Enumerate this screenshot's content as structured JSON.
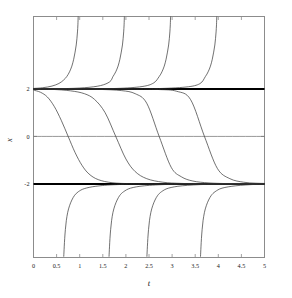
{
  "chart_data": {
    "type": "line",
    "title": "",
    "subtitle": "",
    "xlabel": "t",
    "ylabel": "x",
    "xlim": [
      0,
      5
    ],
    "ylim": [
      -5.1,
      5.05
    ],
    "grid": false,
    "legend": null,
    "legend_position": "none",
    "xticks": [
      0,
      0.5,
      1,
      1.5,
      2,
      2.5,
      3,
      3.5,
      4,
      4.5,
      5
    ],
    "xticklabels": [
      "0",
      "0.5",
      "1",
      "1.5",
      "2",
      "2.5",
      "3",
      "3.5",
      "4",
      "4.5",
      "5"
    ],
    "yticks": [
      2,
      0,
      -2
    ],
    "yticklabels": [
      "2",
      "0",
      "-2"
    ],
    "ticks_on_all_sides": true,
    "annotations": [
      "Equilibrium solution x = 2 drawn as a heavy horizontal line",
      "Equilibrium solution x = -2 drawn as a heavy horizontal line",
      "Thin horizontal reference line at x = 0"
    ],
    "series": [
      {
        "name": "equilibrium-upper",
        "style": "thick-solid",
        "color": "#000000",
        "linewidth": 2.0,
        "x": [
          0,
          5
        ],
        "values": [
          2,
          2
        ]
      },
      {
        "name": "equilibrium-lower",
        "style": "thick-solid",
        "color": "#000000",
        "linewidth": 2.0,
        "x": [
          0,
          5
        ],
        "values": [
          -2,
          -2
        ]
      },
      {
        "name": "zero-reference-line",
        "style": "thin-solid",
        "color": "#6b6b6b",
        "linewidth": 0.7,
        "x": [
          0,
          5
        ],
        "values": [
          0,
          0
        ]
      },
      {
        "name": "blowup-above-2-a",
        "style": "thin-solid",
        "color": "#333333",
        "linewidth": 0.7,
        "blowup_time": 0.97,
        "branch": "above",
        "x": [
          0.0,
          0.2,
          0.4,
          0.55,
          0.65,
          0.72,
          0.78,
          0.83,
          0.87,
          0.9,
          0.925,
          0.94,
          0.952,
          0.961,
          0.967
        ],
        "values": [
          2.02,
          2.05,
          2.12,
          2.23,
          2.37,
          2.52,
          2.72,
          2.96,
          3.25,
          3.55,
          3.85,
          4.12,
          4.4,
          4.7,
          5.05
        ]
      },
      {
        "name": "blowup-above-2-b",
        "style": "thin-solid",
        "color": "#333333",
        "linewidth": 0.7,
        "blowup_time": 1.97,
        "branch": "above",
        "x": [
          0.0,
          0.6,
          1.1,
          1.45,
          1.65,
          1.72,
          1.78,
          1.83,
          1.87,
          1.9,
          1.925,
          1.94,
          1.952,
          1.961,
          1.967
        ],
        "values": [
          2.004,
          2.01,
          2.05,
          2.14,
          2.3,
          2.52,
          2.72,
          2.96,
          3.25,
          3.55,
          3.85,
          4.12,
          4.4,
          4.7,
          5.05
        ]
      },
      {
        "name": "blowup-above-2-c",
        "style": "thin-solid",
        "color": "#333333",
        "linewidth": 0.7,
        "blowup_time": 2.97,
        "branch": "above",
        "x": [
          0.0,
          1.0,
          1.8,
          2.35,
          2.6,
          2.72,
          2.78,
          2.83,
          2.87,
          2.9,
          2.925,
          2.94,
          2.952,
          2.961,
          2.967
        ],
        "values": [
          2.001,
          2.003,
          2.02,
          2.1,
          2.25,
          2.52,
          2.72,
          2.96,
          3.25,
          3.55,
          3.85,
          4.12,
          4.4,
          4.7,
          5.05
        ]
      },
      {
        "name": "blowup-above-2-d",
        "style": "thin-solid",
        "color": "#333333",
        "linewidth": 0.7,
        "blowup_time": 3.97,
        "branch": "above",
        "x": [
          0.0,
          1.6,
          2.6,
          3.3,
          3.6,
          3.72,
          3.78,
          3.83,
          3.87,
          3.9,
          3.925,
          3.94,
          3.952,
          3.961,
          3.967
        ],
        "values": [
          2.0005,
          2.001,
          2.01,
          2.08,
          2.22,
          2.52,
          2.72,
          2.96,
          3.25,
          3.55,
          3.85,
          4.12,
          4.4,
          4.7,
          5.05
        ]
      },
      {
        "name": "sigmoid-decay-a",
        "style": "thin-solid",
        "color": "#333333",
        "linewidth": 0.7,
        "branch": "between",
        "zero_crossing_t": 0.75,
        "x": [
          0.0,
          0.15,
          0.3,
          0.45,
          0.6,
          0.75,
          0.9,
          1.05,
          1.2,
          1.4,
          1.7,
          2.1,
          2.6,
          3.2,
          4.0,
          5.0
        ],
        "values": [
          1.95,
          1.86,
          1.66,
          1.26,
          0.68,
          0.0,
          -0.68,
          -1.22,
          -1.58,
          -1.82,
          -1.95,
          -1.99,
          -2.0,
          -2.0,
          -2.0,
          -2.0
        ]
      },
      {
        "name": "sigmoid-decay-b",
        "style": "thin-solid",
        "color": "#333333",
        "linewidth": 0.7,
        "branch": "between",
        "zero_crossing_t": 1.78,
        "x": [
          0.0,
          0.4,
          0.8,
          1.1,
          1.32,
          1.55,
          1.78,
          2.0,
          2.2,
          2.45,
          2.8,
          3.2,
          3.7,
          4.3,
          5.0
        ],
        "values": [
          1.995,
          1.98,
          1.92,
          1.8,
          1.56,
          1.0,
          0.0,
          -0.95,
          -1.48,
          -1.78,
          -1.93,
          -1.98,
          -2.0,
          -2.0,
          -2.0
        ]
      },
      {
        "name": "sigmoid-decay-c",
        "style": "thin-solid",
        "color": "#333333",
        "linewidth": 0.7,
        "branch": "between",
        "zero_crossing_t": 2.72,
        "x": [
          0.0,
          0.7,
          1.4,
          1.9,
          2.2,
          2.45,
          2.72,
          2.98,
          3.2,
          3.45,
          3.8,
          4.25,
          4.7,
          5.0
        ],
        "values": [
          1.999,
          1.995,
          1.98,
          1.93,
          1.8,
          1.4,
          0.0,
          -1.3,
          -1.7,
          -1.88,
          -1.96,
          -1.99,
          -2.0,
          -2.0
        ]
      },
      {
        "name": "sigmoid-decay-d",
        "style": "thin-solid",
        "color": "#333333",
        "linewidth": 0.7,
        "branch": "between",
        "zero_crossing_t": 3.7,
        "x": [
          0.0,
          1.0,
          2.0,
          2.7,
          3.1,
          3.4,
          3.7,
          3.98,
          4.25,
          4.55,
          4.8,
          5.0
        ],
        "values": [
          1.9995,
          1.999,
          1.995,
          1.975,
          1.9,
          1.55,
          0.0,
          -1.35,
          -1.78,
          -1.93,
          -1.97,
          -1.98
        ]
      },
      {
        "name": "blowup-below-minus2-a",
        "style": "thin-solid",
        "color": "#333333",
        "linewidth": 0.7,
        "blowup_time": 0.62,
        "branch": "below",
        "x": [
          0.655,
          0.665,
          0.675,
          0.69,
          0.71,
          0.74,
          0.78,
          0.83,
          0.89,
          0.97,
          1.1,
          1.35,
          1.8,
          2.6,
          3.8,
          5.0
        ],
        "values": [
          -5.05,
          -4.65,
          -4.3,
          -3.92,
          -3.55,
          -3.2,
          -2.92,
          -2.68,
          -2.48,
          -2.33,
          -2.2,
          -2.1,
          -2.03,
          -2.005,
          -2.0,
          -2.0
        ]
      },
      {
        "name": "blowup-below-minus2-b",
        "style": "thin-solid",
        "color": "#333333",
        "linewidth": 0.7,
        "blowup_time": 1.6,
        "branch": "below",
        "x": [
          1.635,
          1.645,
          1.655,
          1.67,
          1.69,
          1.72,
          1.76,
          1.81,
          1.87,
          1.95,
          2.1,
          2.4,
          2.95,
          3.8,
          5.0
        ],
        "values": [
          -5.05,
          -4.65,
          -4.3,
          -3.92,
          -3.55,
          -3.2,
          -2.92,
          -2.68,
          -2.48,
          -2.33,
          -2.18,
          -2.08,
          -2.02,
          -2.003,
          -2.0
        ]
      },
      {
        "name": "blowup-below-minus2-c",
        "style": "thin-solid",
        "color": "#333333",
        "linewidth": 0.7,
        "blowup_time": 2.42,
        "branch": "below",
        "x": [
          2.455,
          2.465,
          2.475,
          2.49,
          2.51,
          2.54,
          2.58,
          2.63,
          2.69,
          2.77,
          2.92,
          3.22,
          3.75,
          4.5,
          5.0
        ],
        "values": [
          -5.05,
          -4.65,
          -4.3,
          -3.92,
          -3.55,
          -3.2,
          -2.92,
          -2.68,
          -2.48,
          -2.33,
          -2.18,
          -2.08,
          -2.02,
          -2.004,
          -2.0
        ]
      },
      {
        "name": "blowup-below-minus2-d",
        "style": "thin-solid",
        "color": "#333333",
        "linewidth": 0.7,
        "blowup_time": 3.58,
        "branch": "below",
        "x": [
          3.615,
          3.625,
          3.635,
          3.65,
          3.67,
          3.7,
          3.74,
          3.79,
          3.85,
          3.93,
          4.08,
          4.38,
          4.8,
          5.0
        ],
        "values": [
          -5.05,
          -4.65,
          -4.3,
          -3.92,
          -3.55,
          -3.2,
          -2.92,
          -2.68,
          -2.48,
          -2.33,
          -2.18,
          -2.08,
          -2.02,
          -2.01
        ]
      }
    ]
  },
  "figure": {
    "background_color": "#ffffff",
    "frame_color": "#8c8c8c",
    "curve_color": "#333333",
    "equilibrium_color": "#000000",
    "zero_line_color": "#6b6b6b",
    "tick_color": "#8c8c8c"
  }
}
